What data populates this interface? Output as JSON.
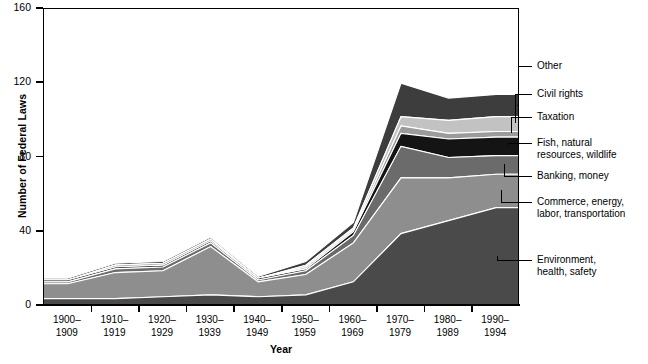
{
  "chart_data": {
    "type": "area",
    "title": "",
    "xlabel": "Year",
    "ylabel": "Number of Federal Laws",
    "ylim": [
      0,
      160
    ],
    "yticks": [
      0,
      40,
      80,
      120,
      160
    ],
    "grid": false,
    "stacked": true,
    "legend_position": "right",
    "categories": [
      "1900–\n1909",
      "1910–\n1919",
      "1920–\n1929",
      "1930–\n1939",
      "1940–\n1949",
      "1950–\n1959",
      "1960–\n1969",
      "1970–\n1979",
      "1980–\n1989",
      "1990–\n1994"
    ],
    "series": [
      {
        "name": "Environment,\nhealth, safety",
        "color": "#4a4a4a",
        "values": [
          4,
          4,
          5,
          6,
          5,
          6,
          13,
          39,
          46,
          53
        ]
      },
      {
        "name": "Commerce, energy,\nlabor, transportation",
        "color": "#8e8e8e",
        "values": [
          8,
          14,
          14,
          26,
          8,
          11,
          21,
          30,
          23,
          18
        ]
      },
      {
        "name": "Banking, money",
        "color": "#6b6b6b",
        "values": [
          1,
          2,
          2,
          2,
          1,
          2,
          4,
          17,
          11,
          10
        ]
      },
      {
        "name": "Fish, natural\nresources, wildlife",
        "color": "#141414",
        "values": [
          1,
          1,
          1,
          1,
          1,
          1,
          2,
          7,
          10,
          10
        ]
      },
      {
        "name": "Taxation",
        "color": "#9b9b9b",
        "values": [
          0,
          1,
          1,
          1,
          0,
          1,
          1,
          4,
          3,
          3
        ]
      },
      {
        "name": "Civil rights",
        "color": "#c2c2c2",
        "values": [
          0,
          0,
          0,
          0,
          0,
          1,
          1,
          5,
          7,
          8
        ]
      },
      {
        "name": "Other",
        "color": "#3d3d3d",
        "values": [
          1,
          1,
          1,
          1,
          1,
          2,
          3,
          18,
          12,
          12
        ]
      }
    ],
    "totals": [
      15,
      23,
      24,
      37,
      16,
      24,
      45,
      120,
      112,
      114
    ]
  },
  "legend": {
    "items": [
      {
        "label": "Other"
      },
      {
        "label": "Civil rights"
      },
      {
        "label": "Taxation"
      },
      {
        "label": "Fish, natural\nresources, wildlife"
      },
      {
        "label": "Banking, money"
      },
      {
        "label": "Commerce, energy,\nlabor, transportation"
      },
      {
        "label": "Environment,\nhealth, safety"
      }
    ]
  },
  "axes": {
    "y_title": "Number of Federal Laws",
    "x_title": "Year",
    "y_tick_labels": [
      "0",
      "40",
      "80",
      "120",
      "160"
    ],
    "x_tick_labels": [
      "1900–\n1909",
      "1910–\n1919",
      "1920–\n1929",
      "1930–\n1939",
      "1940–\n1949",
      "1950–\n1959",
      "1960–\n1969",
      "1970–\n1979",
      "1980–\n1989",
      "1990–\n1994"
    ]
  },
  "footer": {
    "source": ""
  }
}
